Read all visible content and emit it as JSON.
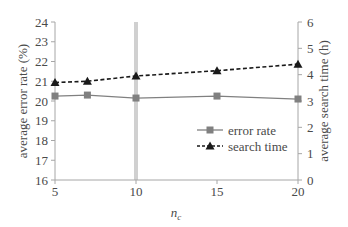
{
  "chart_data": {
    "type": "line",
    "title": "",
    "xlabel": "n_c",
    "xlabel_main": "n",
    "xlabel_sub": "c",
    "ylabel": "average error rate (%)",
    "y2label": "average search time (h)",
    "x": [
      5,
      7,
      10,
      15,
      20
    ],
    "x_ticks": [
      5,
      10,
      15,
      20
    ],
    "xlim": [
      5,
      20
    ],
    "ylim": [
      16,
      24
    ],
    "y_ticks": [
      16,
      17,
      18,
      19,
      20,
      21,
      22,
      23,
      24
    ],
    "y2lim": [
      0,
      6
    ],
    "y2_ticks": [
      0,
      1,
      2,
      3,
      4,
      5,
      6
    ],
    "grid": false,
    "highlight_x": 10,
    "legend_position": "inside-right",
    "series": [
      {
        "name": "error rate",
        "axis": "left",
        "marker": "square",
        "line": "solid",
        "color": "#808080",
        "values": [
          20.25,
          20.3,
          20.15,
          20.25,
          20.1
        ]
      },
      {
        "name": "search time",
        "axis": "right",
        "marker": "triangle",
        "line": "dashed",
        "color": "#1a1a1a",
        "values": [
          3.7,
          3.75,
          3.95,
          4.15,
          4.4
        ]
      }
    ]
  },
  "colors": {
    "axis": "#a6a6a6",
    "highlight": "#d0d0d0",
    "text": "#4a4a4a"
  }
}
